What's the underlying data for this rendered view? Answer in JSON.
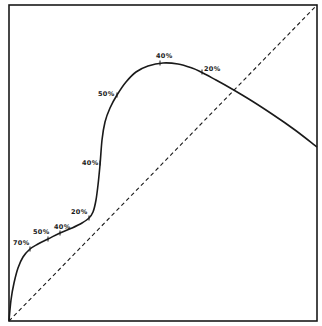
{
  "chart_data": {
    "type": "line",
    "title": "",
    "xlabel": "",
    "ylabel": "",
    "grid": false,
    "legend": null,
    "axis_ranges": {
      "x": [
        0,
        1
      ],
      "y": [
        0,
        1
      ]
    },
    "frame_px": {
      "left": 9,
      "top": 5,
      "right": 317,
      "bottom": 321
    },
    "series": [
      {
        "name": "curve",
        "style": "solid",
        "color": "#1a1a1a",
        "points_px": [
          [
            9,
            321
          ],
          [
            11,
            300
          ],
          [
            14,
            283
          ],
          [
            18,
            268
          ],
          [
            23,
            257
          ],
          [
            30,
            249
          ],
          [
            38,
            244
          ],
          [
            48,
            239
          ],
          [
            60,
            233
          ],
          [
            72,
            228
          ],
          [
            82,
            223
          ],
          [
            89,
            218
          ],
          [
            93,
            212
          ],
          [
            96,
            200
          ],
          [
            98,
            185
          ],
          [
            100,
            165
          ],
          [
            102,
            140
          ],
          [
            105,
            122
          ],
          [
            110,
            108
          ],
          [
            117,
            95
          ],
          [
            126,
            82
          ],
          [
            136,
            72
          ],
          [
            148,
            66
          ],
          [
            163,
            63
          ],
          [
            178,
            64
          ],
          [
            192,
            68
          ],
          [
            201,
            72
          ],
          [
            216,
            80
          ],
          [
            232,
            89
          ],
          [
            252,
            101
          ],
          [
            272,
            114
          ],
          [
            295,
            130
          ],
          [
            317,
            147
          ]
        ],
        "annotations": [
          {
            "text": "70%",
            "tick": [
              30,
              249
            ],
            "label_pos": [
              13,
              245
            ]
          },
          {
            "text": "50%",
            "tick": [
              48,
              239
            ],
            "label_pos": [
              33,
              234
            ]
          },
          {
            "text": "40%",
            "tick": [
              60,
              233
            ],
            "label_pos": [
              54,
              229
            ]
          },
          {
            "text": "20%",
            "tick": [
              89,
              218
            ],
            "label_pos": [
              71,
              214
            ]
          },
          {
            "text": "40%",
            "tick": [
              100,
              163
            ],
            "label_pos": [
              82,
              165
            ]
          },
          {
            "text": "50%",
            "tick": [
              117,
              95
            ],
            "label_pos": [
              98,
              96
            ]
          },
          {
            "text": "40%",
            "tick": [
              160,
              63
            ],
            "label_pos": [
              156,
              58
            ]
          },
          {
            "text": "20%",
            "tick": [
              202,
              72
            ],
            "label_pos": [
              204,
              71
            ]
          }
        ]
      },
      {
        "name": "diagonal",
        "style": "dashed",
        "color": "#1a1a1a",
        "x": [
          0,
          1
        ],
        "y": [
          0,
          1
        ],
        "points_px": [
          [
            9,
            321
          ],
          [
            317,
            5
          ]
        ]
      }
    ]
  },
  "colors": {
    "ink": "#1a1a1a",
    "background": "#ffffff"
  }
}
